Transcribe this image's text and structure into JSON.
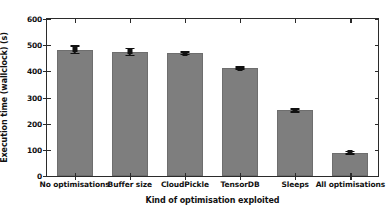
{
  "chart_data": {
    "type": "bar",
    "title": "",
    "xlabel": "Kind of optimisation exploited",
    "ylabel": "Execution time (wallclock) (s)",
    "categories": [
      "No optimisations",
      "Buffer size",
      "CloudPickle",
      "TensorDB",
      "Sleeps",
      "All optimisations"
    ],
    "values": [
      482,
      474,
      469,
      412,
      251,
      89
    ],
    "errors": [
      14,
      13,
      4,
      4,
      6,
      4
    ],
    "ylim": [
      0,
      600
    ],
    "yticks": [
      0,
      100,
      200,
      300,
      400,
      500,
      600
    ],
    "ytick_labels": [
      "0",
      "100",
      "200",
      "300",
      "400",
      "500",
      "600"
    ],
    "grid": false,
    "legend": null,
    "bar_color": "#7e7e7e",
    "error_color": "#111111",
    "axis_color": "#2b2b2b",
    "background": "#ffffff"
  }
}
